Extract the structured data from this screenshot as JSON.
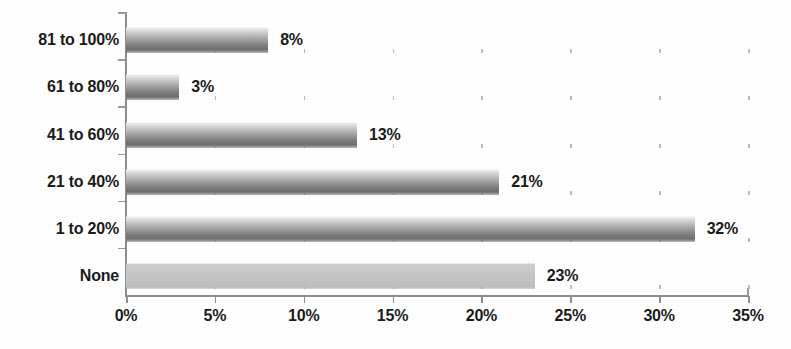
{
  "chart_data": {
    "type": "bar",
    "orientation": "horizontal",
    "title": "",
    "subtitle": "",
    "xlabel": "",
    "ylabel": "",
    "categories": [
      "None",
      "1 to 20%",
      "21 to 40%",
      "41 to 60%",
      "61 to 80%",
      "81 to 100%"
    ],
    "values": [
      23,
      32,
      21,
      13,
      3,
      8
    ],
    "data_labels": [
      "23%",
      "32%",
      "21%",
      "13%",
      "3%",
      "8%"
    ],
    "xlim": [
      0,
      35
    ],
    "xtick_values": [
      0,
      5,
      10,
      15,
      20,
      25,
      30,
      35
    ],
    "xtick_labels": [
      "0%",
      "5%",
      "10%",
      "15%",
      "20%",
      "25%",
      "30%",
      "35%"
    ],
    "grid": false,
    "legend": false,
    "legend_position": "none",
    "bar_colors": {
      "default_top": "#f2f2f2",
      "default_bottom": "#6f6f6f",
      "highlight_flat": "#c6c6c6",
      "axis": "#8e8e8e",
      "text": "#1b1b1b",
      "background": "#ffffff"
    },
    "series": [
      {
        "name": "Percent of respondents",
        "points": [
          {
            "category": "81 to 100%",
            "value": 8,
            "label": "8%",
            "style": "gradient"
          },
          {
            "category": "61 to 80%",
            "value": 3,
            "label": "3%",
            "style": "gradient"
          },
          {
            "category": "41 to 60%",
            "value": 13,
            "label": "13%",
            "style": "gradient"
          },
          {
            "category": "21 to 40%",
            "value": 21,
            "label": "21%",
            "style": "gradient"
          },
          {
            "category": "1 to 20%",
            "value": 32,
            "label": "32%",
            "style": "gradient"
          },
          {
            "category": "None",
            "value": 23,
            "label": "23%",
            "style": "flat"
          }
        ]
      }
    ]
  }
}
